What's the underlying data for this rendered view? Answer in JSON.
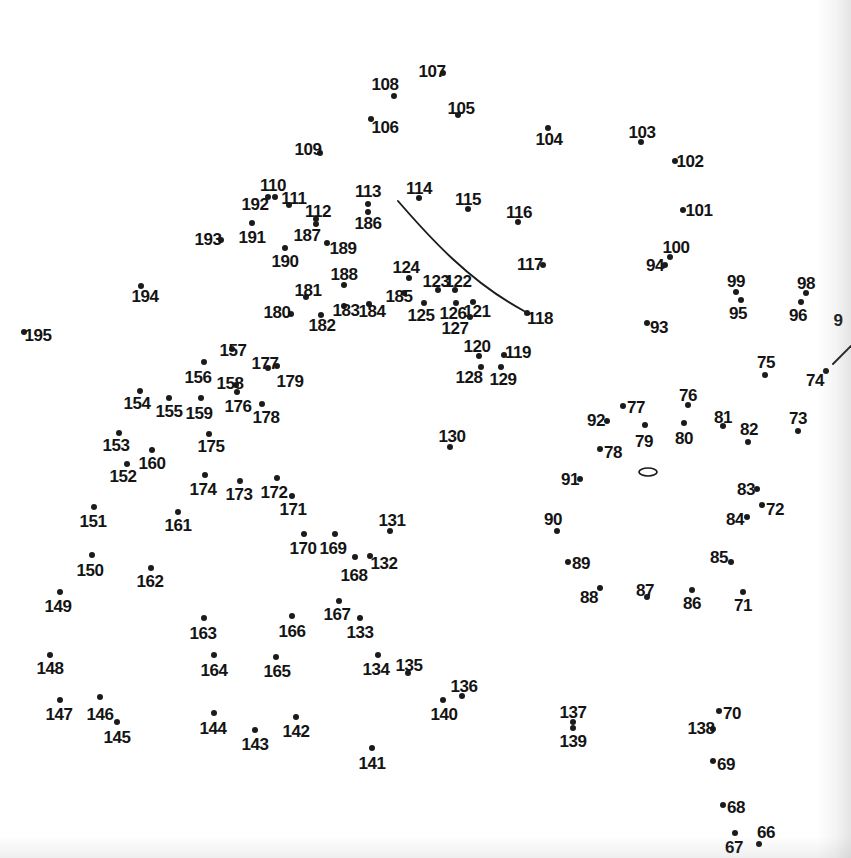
{
  "page": {
    "kind": "dot-to-dot-puzzle",
    "width": 851,
    "height": 858,
    "background_color": "#ffffff",
    "ink_color": "#1b1b1b",
    "dot_count": 130,
    "number_range": "66-195"
  },
  "dots": [
    {
      "n": "107",
      "dx": 443,
      "dy": 73,
      "lx": 432,
      "ly": 71,
      "lpos": "left"
    },
    {
      "n": "108",
      "dx": 394,
      "dy": 96,
      "lx": 385,
      "ly": 84,
      "lpos": "above"
    },
    {
      "n": "105",
      "dx": 458,
      "dy": 115,
      "lx": 461,
      "ly": 108,
      "lpos": "above"
    },
    {
      "n": "106",
      "dx": 371,
      "dy": 119,
      "lx": 385,
      "ly": 127,
      "lpos": "right"
    },
    {
      "n": "104",
      "dx": 548,
      "dy": 128,
      "lx": 549,
      "ly": 139,
      "lpos": "below"
    },
    {
      "n": "103",
      "dx": 641,
      "dy": 142,
      "lx": 642,
      "ly": 132,
      "lpos": "above"
    },
    {
      "n": "109",
      "dx": 320,
      "dy": 153,
      "lx": 308,
      "ly": 149,
      "lpos": "left"
    },
    {
      "n": "102",
      "dx": 675,
      "dy": 161,
      "lx": 690,
      "ly": 161,
      "lpos": "right"
    },
    {
      "n": "110",
      "dx": 275,
      "dy": 197,
      "lx": 273,
      "ly": 185,
      "lpos": "above"
    },
    {
      "n": "111",
      "dx": 289,
      "dy": 205,
      "lx": 294,
      "ly": 198,
      "lpos": "right"
    },
    {
      "n": "192",
      "dx": 268,
      "dy": 197,
      "lx": 255,
      "ly": 204,
      "lpos": "left"
    },
    {
      "n": "112",
      "dx": 316,
      "dy": 219,
      "lx": 318,
      "ly": 211,
      "lpos": "above"
    },
    {
      "n": "113",
      "dx": 368,
      "dy": 204,
      "lx": 368,
      "ly": 191,
      "lpos": "above"
    },
    {
      "n": "114",
      "dx": 419,
      "dy": 198,
      "lx": 419,
      "ly": 188,
      "lpos": "above"
    },
    {
      "n": "115",
      "dx": 468,
      "dy": 209,
      "lx": 468,
      "ly": 199,
      "lpos": "above"
    },
    {
      "n": "116",
      "dx": 518,
      "dy": 222,
      "lx": 519,
      "ly": 212,
      "lpos": "above"
    },
    {
      "n": "101",
      "dx": 683,
      "dy": 210,
      "lx": 699,
      "ly": 210,
      "lpos": "right"
    },
    {
      "n": "186",
      "dx": 368,
      "dy": 212,
      "lx": 368,
      "ly": 223,
      "lpos": "below"
    },
    {
      "n": "191",
      "dx": 252,
      "dy": 223,
      "lx": 252,
      "ly": 237,
      "lpos": "below"
    },
    {
      "n": "187",
      "dx": 316,
      "dy": 224,
      "lx": 307,
      "ly": 235,
      "lpos": "below-left"
    },
    {
      "n": "193",
      "dx": 221,
      "dy": 240,
      "lx": 208,
      "ly": 239,
      "lpos": "left"
    },
    {
      "n": "100",
      "dx": 670,
      "dy": 257,
      "lx": 676,
      "ly": 247,
      "lpos": "above"
    },
    {
      "n": "94",
      "dx": 665,
      "dy": 265,
      "lx": 655,
      "ly": 265,
      "lpos": "left"
    },
    {
      "n": "189",
      "dx": 327,
      "dy": 243,
      "lx": 343,
      "ly": 248,
      "lpos": "right"
    },
    {
      "n": "190",
      "dx": 285,
      "dy": 248,
      "lx": 285,
      "ly": 261,
      "lpos": "below"
    },
    {
      "n": "117",
      "dx": 543,
      "dy": 265,
      "lx": 530,
      "ly": 264,
      "lpos": "left"
    },
    {
      "n": "124",
      "dx": 409,
      "dy": 278,
      "lx": 406,
      "ly": 267,
      "lpos": "above"
    },
    {
      "n": "99",
      "dx": 736,
      "dy": 292,
      "lx": 736,
      "ly": 281,
      "lpos": "above"
    },
    {
      "n": "98",
      "dx": 806,
      "dy": 293,
      "lx": 806,
      "ly": 283,
      "lpos": "above"
    },
    {
      "n": "188",
      "dx": 344,
      "dy": 285,
      "lx": 344,
      "ly": 274,
      "lpos": "above"
    },
    {
      "n": "123",
      "dx": 438,
      "dy": 290,
      "lx": 436,
      "ly": 281,
      "lpos": "above"
    },
    {
      "n": "122",
      "dx": 455,
      "dy": 290,
      "lx": 458,
      "ly": 281,
      "lpos": "above"
    },
    {
      "n": "185",
      "dx": 404,
      "dy": 293,
      "lx": 399,
      "ly": 296,
      "lpos": "below-left"
    },
    {
      "n": "181",
      "dx": 306,
      "dy": 297,
      "lx": 308,
      "ly": 290,
      "lpos": "above"
    },
    {
      "n": "95",
      "dx": 741,
      "dy": 300,
      "lx": 738,
      "ly": 313,
      "lpos": "below"
    },
    {
      "n": "96",
      "dx": 801,
      "dy": 302,
      "lx": 798,
      "ly": 315,
      "lpos": "below"
    },
    {
      "n": "121",
      "dx": 473,
      "dy": 302,
      "lx": 477,
      "ly": 311,
      "lpos": "right"
    },
    {
      "n": "126",
      "dx": 456,
      "dy": 303,
      "lx": 453,
      "ly": 313,
      "lpos": "below"
    },
    {
      "n": "194",
      "dx": 141,
      "dy": 286,
      "lx": 145,
      "ly": 296,
      "lpos": "below"
    },
    {
      "n": "180",
      "dx": 291,
      "dy": 314,
      "lx": 277,
      "ly": 312,
      "lpos": "left"
    },
    {
      "n": "183",
      "dx": 344,
      "dy": 306,
      "lx": 346,
      "ly": 310,
      "lpos": "right"
    },
    {
      "n": "184",
      "dx": 369,
      "dy": 304,
      "lx": 372,
      "ly": 311,
      "lpos": "right"
    },
    {
      "n": "125",
      "dx": 424,
      "dy": 303,
      "lx": 421,
      "ly": 315,
      "lpos": "below"
    },
    {
      "n": "182",
      "dx": 321,
      "dy": 315,
      "lx": 322,
      "ly": 325,
      "lpos": "below"
    },
    {
      "n": "127",
      "dx": 470,
      "dy": 317,
      "lx": 455,
      "ly": 328,
      "lpos": "below-left"
    },
    {
      "n": "118",
      "dx": 527,
      "dy": 313,
      "lx": 540,
      "ly": 318,
      "lpos": "right"
    },
    {
      "n": "93",
      "dx": 647,
      "dy": 323,
      "lx": 659,
      "ly": 327,
      "lpos": "right"
    },
    {
      "n": "9",
      "dx": null,
      "dy": null,
      "lx": 838,
      "ly": 320,
      "lpos": "cut-off"
    },
    {
      "n": "195",
      "dx": 24,
      "dy": 332,
      "lx": 38,
      "ly": 335,
      "lpos": "right"
    },
    {
      "n": "120",
      "dx": 479,
      "dy": 356,
      "lx": 477,
      "ly": 346,
      "lpos": "above"
    },
    {
      "n": "119",
      "dx": 504,
      "dy": 355,
      "lx": 518,
      "ly": 352,
      "lpos": "right"
    },
    {
      "n": "157",
      "dx": 232,
      "dy": 349,
      "lx": 233,
      "ly": 350,
      "lpos": "above"
    },
    {
      "n": "177",
      "dx": 268,
      "dy": 368,
      "lx": 265,
      "ly": 363,
      "lpos": "above"
    },
    {
      "n": "179",
      "dx": 277,
      "dy": 366,
      "lx": 290,
      "ly": 381,
      "lpos": "below-right"
    },
    {
      "n": "156",
      "dx": 204,
      "dy": 362,
      "lx": 198,
      "ly": 377,
      "lpos": "below"
    },
    {
      "n": "128",
      "dx": 481,
      "dy": 367,
      "lx": 469,
      "ly": 377,
      "lpos": "below-left"
    },
    {
      "n": "129",
      "dx": 501,
      "dy": 367,
      "lx": 503,
      "ly": 379,
      "lpos": "below"
    },
    {
      "n": "158",
      "dx": 236,
      "dy": 385,
      "lx": 230,
      "ly": 383,
      "lpos": "left"
    },
    {
      "n": "75",
      "dx": 765,
      "dy": 375,
      "lx": 766,
      "ly": 362,
      "lpos": "above"
    },
    {
      "n": "74",
      "dx": 826,
      "dy": 371,
      "lx": 815,
      "ly": 380,
      "lpos": "left"
    },
    {
      "n": "76",
      "dx": 688,
      "dy": 405,
      "lx": 688,
      "ly": 395,
      "lpos": "above"
    },
    {
      "n": "77",
      "dx": 623,
      "dy": 406,
      "lx": 636,
      "ly": 407,
      "lpos": "right"
    },
    {
      "n": "154",
      "dx": 140,
      "dy": 391,
      "lx": 137,
      "ly": 403,
      "lpos": "below"
    },
    {
      "n": "155",
      "dx": 169,
      "dy": 398,
      "lx": 169,
      "ly": 411,
      "lpos": "below"
    },
    {
      "n": "159",
      "dx": 201,
      "dy": 398,
      "lx": 199,
      "ly": 413,
      "lpos": "below"
    },
    {
      "n": "176",
      "dx": 237,
      "dy": 392,
      "lx": 238,
      "ly": 406,
      "lpos": "below"
    },
    {
      "n": "178",
      "dx": 262,
      "dy": 404,
      "lx": 266,
      "ly": 417,
      "lpos": "below"
    },
    {
      "n": "92",
      "dx": 607,
      "dy": 421,
      "lx": 596,
      "ly": 420,
      "lpos": "left"
    },
    {
      "n": "81",
      "dx": 723,
      "dy": 426,
      "lx": 723,
      "ly": 417,
      "lpos": "above"
    },
    {
      "n": "73",
      "dx": 798,
      "dy": 431,
      "lx": 798,
      "ly": 418,
      "lpos": "above"
    },
    {
      "n": "80",
      "dx": 684,
      "dy": 423,
      "lx": 684,
      "ly": 438,
      "lpos": "below"
    },
    {
      "n": "79",
      "dx": 645,
      "dy": 425,
      "lx": 644,
      "ly": 441,
      "lpos": "below"
    },
    {
      "n": "82",
      "dx": 748,
      "dy": 442,
      "lx": 749,
      "ly": 429,
      "lpos": "above"
    },
    {
      "n": "153",
      "dx": 119,
      "dy": 433,
      "lx": 116,
      "ly": 445,
      "lpos": "below"
    },
    {
      "n": "78",
      "dx": 600,
      "dy": 449,
      "lx": 613,
      "ly": 452,
      "lpos": "right"
    },
    {
      "n": "175",
      "dx": 209,
      "dy": 434,
      "lx": 211,
      "ly": 446,
      "lpos": "below"
    },
    {
      "n": "160",
      "dx": 152,
      "dy": 450,
      "lx": 152,
      "ly": 463,
      "lpos": "below"
    },
    {
      "n": "130",
      "dx": 450,
      "dy": 447,
      "lx": 452,
      "ly": 436,
      "lpos": "above"
    },
    {
      "n": "152",
      "dx": 127,
      "dy": 464,
      "lx": 123,
      "ly": 476,
      "lpos": "below"
    },
    {
      "n": "91",
      "dx": 580,
      "dy": 479,
      "lx": 570,
      "ly": 479,
      "lpos": "left"
    },
    {
      "n": "83",
      "dx": 757,
      "dy": 489,
      "lx": 746,
      "ly": 489,
      "lpos": "left"
    },
    {
      "n": "174",
      "dx": 205,
      "dy": 475,
      "lx": 203,
      "ly": 489,
      "lpos": "below"
    },
    {
      "n": "173",
      "dx": 240,
      "dy": 481,
      "lx": 239,
      "ly": 494,
      "lpos": "below"
    },
    {
      "n": "172",
      "dx": 277,
      "dy": 478,
      "lx": 274,
      "ly": 492,
      "lpos": "below"
    },
    {
      "n": "171",
      "dx": 292,
      "dy": 496,
      "lx": 293,
      "ly": 509,
      "lpos": "below"
    },
    {
      "n": "72",
      "dx": 762,
      "dy": 505,
      "lx": 775,
      "ly": 509,
      "lpos": "right"
    },
    {
      "n": "84",
      "dx": 747,
      "dy": 517,
      "lx": 735,
      "ly": 519,
      "lpos": "left"
    },
    {
      "n": "151",
      "dx": 94,
      "dy": 507,
      "lx": 93,
      "ly": 521,
      "lpos": "below"
    },
    {
      "n": "161",
      "dx": 178,
      "dy": 512,
      "lx": 178,
      "ly": 525,
      "lpos": "below"
    },
    {
      "n": "131",
      "dx": 390,
      "dy": 531,
      "lx": 392,
      "ly": 520,
      "lpos": "above"
    },
    {
      "n": "90",
      "dx": 557,
      "dy": 531,
      "lx": 553,
      "ly": 519,
      "lpos": "above"
    },
    {
      "n": "170",
      "dx": 304,
      "dy": 534,
      "lx": 303,
      "ly": 548,
      "lpos": "below"
    },
    {
      "n": "169",
      "dx": 335,
      "dy": 534,
      "lx": 333,
      "ly": 548,
      "lpos": "below"
    },
    {
      "n": "85",
      "dx": 731,
      "dy": 562,
      "lx": 719,
      "ly": 557,
      "lpos": "left"
    },
    {
      "n": "132",
      "dx": 370,
      "dy": 556,
      "lx": 384,
      "ly": 563,
      "lpos": "right"
    },
    {
      "n": "168",
      "dx": 355,
      "dy": 557,
      "lx": 354,
      "ly": 575,
      "lpos": "below"
    },
    {
      "n": "89",
      "dx": 568,
      "dy": 562,
      "lx": 581,
      "ly": 563,
      "lpos": "right"
    },
    {
      "n": "150",
      "dx": 92,
      "dy": 555,
      "lx": 90,
      "ly": 570,
      "lpos": "below"
    },
    {
      "n": "162",
      "dx": 151,
      "dy": 568,
      "lx": 150,
      "ly": 581,
      "lpos": "below"
    },
    {
      "n": "88",
      "dx": 600,
      "dy": 588,
      "lx": 589,
      "ly": 597,
      "lpos": "below-left"
    },
    {
      "n": "87",
      "dx": 647,
      "dy": 597,
      "lx": 645,
      "ly": 590,
      "lpos": "above"
    },
    {
      "n": "86",
      "dx": 692,
      "dy": 590,
      "lx": 692,
      "ly": 603,
      "lpos": "below"
    },
    {
      "n": "71",
      "dx": 743,
      "dy": 592,
      "lx": 743,
      "ly": 605,
      "lpos": "below"
    },
    {
      "n": "167",
      "dx": 339,
      "dy": 601,
      "lx": 337,
      "ly": 614,
      "lpos": "below"
    },
    {
      "n": "149",
      "dx": 60,
      "dy": 592,
      "lx": 58,
      "ly": 606,
      "lpos": "below"
    },
    {
      "n": "163",
      "dx": 204,
      "dy": 618,
      "lx": 203,
      "ly": 633,
      "lpos": "below"
    },
    {
      "n": "166",
      "dx": 292,
      "dy": 616,
      "lx": 292,
      "ly": 631,
      "lpos": "below"
    },
    {
      "n": "133",
      "dx": 360,
      "dy": 618,
      "lx": 360,
      "ly": 632,
      "lpos": "below"
    },
    {
      "n": "148",
      "dx": 50,
      "dy": 655,
      "lx": 50,
      "ly": 668,
      "lpos": "below"
    },
    {
      "n": "164",
      "dx": 214,
      "dy": 655,
      "lx": 214,
      "ly": 670,
      "lpos": "below"
    },
    {
      "n": "165",
      "dx": 276,
      "dy": 657,
      "lx": 277,
      "ly": 671,
      "lpos": "below"
    },
    {
      "n": "134",
      "dx": 378,
      "dy": 655,
      "lx": 376,
      "ly": 669,
      "lpos": "below"
    },
    {
      "n": "135",
      "dx": 408,
      "dy": 673,
      "lx": 409,
      "ly": 665,
      "lpos": "above"
    },
    {
      "n": "136",
      "dx": 462,
      "dy": 696,
      "lx": 464,
      "ly": 686,
      "lpos": "above"
    },
    {
      "n": "140",
      "dx": 443,
      "dy": 700,
      "lx": 444,
      "ly": 714,
      "lpos": "below"
    },
    {
      "n": "147",
      "dx": 60,
      "dy": 700,
      "lx": 59,
      "ly": 714,
      "lpos": "below"
    },
    {
      "n": "146",
      "dx": 100,
      "dy": 697,
      "lx": 100,
      "ly": 714,
      "lpos": "below"
    },
    {
      "n": "145",
      "dx": 117,
      "dy": 722,
      "lx": 117,
      "ly": 737,
      "lpos": "below"
    },
    {
      "n": "144",
      "dx": 214,
      "dy": 713,
      "lx": 213,
      "ly": 728,
      "lpos": "below"
    },
    {
      "n": "143",
      "dx": 255,
      "dy": 730,
      "lx": 255,
      "ly": 744,
      "lpos": "below"
    },
    {
      "n": "142",
      "dx": 296,
      "dy": 717,
      "lx": 296,
      "ly": 731,
      "lpos": "below"
    },
    {
      "n": "137",
      "dx": 573,
      "dy": 722,
      "lx": 573,
      "ly": 712,
      "lpos": "above"
    },
    {
      "n": "139",
      "dx": 573,
      "dy": 728,
      "lx": 573,
      "ly": 741,
      "lpos": "below"
    },
    {
      "n": "70",
      "dx": 719,
      "dy": 711,
      "lx": 732,
      "ly": 713,
      "lpos": "right"
    },
    {
      "n": "138",
      "dx": 713,
      "dy": 729,
      "lx": 701,
      "ly": 728,
      "lpos": "left"
    },
    {
      "n": "141",
      "dx": 372,
      "dy": 748,
      "lx": 372,
      "ly": 763,
      "lpos": "below"
    },
    {
      "n": "69",
      "dx": 713,
      "dy": 761,
      "lx": 726,
      "ly": 764,
      "lpos": "right"
    },
    {
      "n": "68",
      "dx": 723,
      "dy": 805,
      "lx": 736,
      "ly": 807,
      "lpos": "right"
    },
    {
      "n": "67",
      "dx": 735,
      "dy": 833,
      "lx": 734,
      "ly": 847,
      "lpos": "below"
    },
    {
      "n": "66",
      "dx": 759,
      "dy": 844,
      "lx": 766,
      "ly": 832,
      "lpos": "above"
    }
  ],
  "guide_marks": [
    {
      "name": "long-curve-114-to-118",
      "type": "path",
      "d": "M 398,201 C 430,238 470,282 524,311"
    },
    {
      "name": "short-stroke-near-74",
      "type": "path",
      "d": "M 833,364 L 851,346"
    },
    {
      "name": "small-ellipse-outline",
      "type": "ellipse",
      "cx": 648,
      "cy": 472,
      "rx": 9,
      "ry": 4
    }
  ]
}
